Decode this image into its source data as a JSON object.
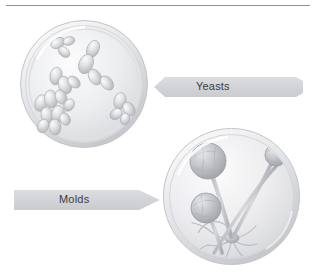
{
  "figure": {
    "kind": "illustration",
    "background_color": "#ffffff",
    "rule": {
      "name": "top-divider-rule",
      "color": "#8d8f92"
    }
  },
  "labels": {
    "yeasts": "Yeasts",
    "molds": "Molds"
  },
  "arrows": [
    {
      "label": "Yeasts",
      "direction": "left",
      "fill_color": "#d4d5d7",
      "points_to": "yeast-petri-dish"
    },
    {
      "label": "Molds",
      "direction": "right",
      "fill_color": "#d4d5d7",
      "points_to": "mold-petri-dish"
    }
  ],
  "specimens": [
    {
      "name": "yeast-petri-dish",
      "subject": "Yeasts",
      "description": "Budding oval yeast cells scattered in a petri dish",
      "dish_color": "#e8e9ea",
      "cell_color": "#c9cace"
    },
    {
      "name": "mold-petri-dish",
      "subject": "Molds",
      "description": "Mold sporangiophores with round sporangia heads and rhizoids in a petri dish",
      "dish_color": "#e8e9ea",
      "cell_color": "#b9bbc0"
    }
  ],
  "icons": {
    "yeast_cell": "yeast-cell-icon",
    "sporangium": "sporangium-icon",
    "petri_dish": "petri-dish-icon"
  }
}
